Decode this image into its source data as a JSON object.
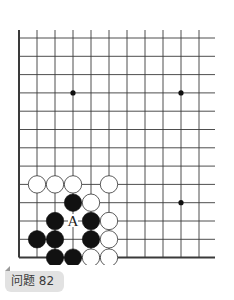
{
  "problem": {
    "label": "问题 82"
  },
  "board": {
    "origin_x": 19,
    "origin_y": 38,
    "spacing_x": 18,
    "spacing_y": 18.3,
    "columns": 11,
    "rows": 13,
    "right_extent": 215,
    "top_extension": 30,
    "line_color": "#3a3a3a",
    "edges": [
      "left",
      "bottom"
    ],
    "star_points": [
      {
        "col": 3,
        "row": 3
      },
      {
        "col": 9,
        "row": 3
      },
      {
        "col": 9,
        "row": 9
      }
    ],
    "stones": [
      {
        "color": "white",
        "col": 1,
        "row": 8
      },
      {
        "color": "white",
        "col": 2,
        "row": 8
      },
      {
        "color": "white",
        "col": 3,
        "row": 8
      },
      {
        "color": "white",
        "col": 5,
        "row": 8
      },
      {
        "color": "black",
        "col": 3,
        "row": 9
      },
      {
        "color": "white",
        "col": 4,
        "row": 9
      },
      {
        "color": "black",
        "col": 2,
        "row": 10
      },
      {
        "color": "black",
        "col": 4,
        "row": 10
      },
      {
        "color": "white",
        "col": 5,
        "row": 10
      },
      {
        "color": "black",
        "col": 1,
        "row": 11
      },
      {
        "color": "black",
        "col": 2,
        "row": 11
      },
      {
        "color": "black",
        "col": 4,
        "row": 11
      },
      {
        "color": "white",
        "col": 5,
        "row": 11
      },
      {
        "color": "black",
        "col": 2,
        "row": 12
      },
      {
        "color": "black",
        "col": 3,
        "row": 12
      },
      {
        "color": "white",
        "col": 4,
        "row": 12
      },
      {
        "color": "white",
        "col": 5,
        "row": 12
      }
    ],
    "labels": [
      {
        "text": "A",
        "col": 3,
        "row": 10
      }
    ]
  }
}
